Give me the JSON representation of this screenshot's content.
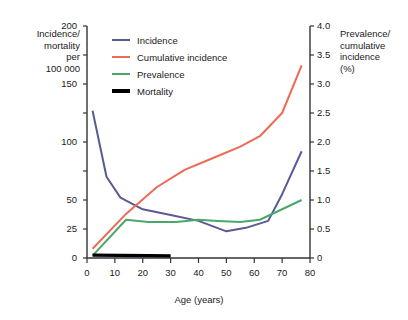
{
  "chart_data": {
    "type": "line",
    "title": "",
    "xlabel": "Age (years)",
    "ylabel": "Incidence/ mortality per 100 000",
    "ylabel_right": "Prevalence/ cumulative incidence (%)",
    "xlim": [
      0,
      80
    ],
    "ylim": [
      0,
      200
    ],
    "ylim_right": [
      0,
      4.0
    ],
    "grid": false,
    "legend_position": "top-left-inside",
    "xticks": [
      0,
      10,
      20,
      30,
      40,
      50,
      60,
      70,
      80
    ],
    "xtick_labels": [
      "0",
      "10",
      "20",
      "30",
      "40",
      "50",
      "60",
      "70",
      "80"
    ],
    "yticks_left": [
      0,
      25,
      50,
      75,
      100,
      125,
      150,
      175,
      200
    ],
    "ytick_labels_left": [
      "0",
      "25",
      "50",
      "",
      "100",
      "",
      "150",
      "",
      "200"
    ],
    "yticks_right": [
      0,
      0.5,
      1.0,
      1.5,
      2.0,
      2.5,
      3.0,
      3.5,
      4.0
    ],
    "ytick_labels_right": [
      "0",
      "0.5",
      "1.0",
      "1.5",
      "2.0",
      "2.5",
      "3.0",
      "3.5",
      "4.0"
    ],
    "series": [
      {
        "name": "Incidence",
        "color": "#5a5a96",
        "axis": "left",
        "width": 2,
        "x": [
          2,
          7,
          12,
          20,
          30,
          40,
          50,
          57,
          65,
          70,
          77
        ],
        "values": [
          127,
          70,
          52,
          42,
          37,
          32,
          23,
          26,
          32,
          55,
          92
        ]
      },
      {
        "name": "Cumulative incidence",
        "color": "#ee6a55",
        "axis": "right",
        "width": 2,
        "x": [
          2,
          14,
          25,
          35,
          45,
          55,
          62,
          70,
          77
        ],
        "values": [
          0.16,
          0.76,
          1.22,
          1.52,
          1.72,
          1.92,
          2.1,
          2.5,
          3.32
        ]
      },
      {
        "name": "Prevalence",
        "color": "#4aa96a",
        "axis": "right",
        "width": 2,
        "x": [
          2,
          14,
          22,
          32,
          40,
          47,
          55,
          62,
          70,
          77
        ],
        "values": [
          0.04,
          0.66,
          0.62,
          0.62,
          0.66,
          0.64,
          0.62,
          0.66,
          0.84,
          1.0
        ]
      },
      {
        "name": "Mortality",
        "color": "#000000",
        "axis": "left",
        "width": 3.2,
        "x": [
          2,
          12,
          22,
          30
        ],
        "values": [
          2.5,
          2.2,
          2.0,
          1.8
        ]
      }
    ]
  },
  "legend": {
    "items": [
      {
        "label": "Incidence",
        "color": "#5a5a96",
        "thick": false
      },
      {
        "label": "Cumulative incidence",
        "color": "#ee6a55",
        "thick": false
      },
      {
        "label": "Prevalence",
        "color": "#4aa96a",
        "thick": false
      },
      {
        "label": "Mortality",
        "color": "#000000",
        "thick": true
      }
    ]
  },
  "axis_titles": {
    "left_line1": "Incidence/",
    "left_line2": "mortality",
    "left_line3": "per",
    "left_line4": "100 000",
    "right_line1": "Prevalence/",
    "right_line2": "cumulative",
    "right_line3": "incidence",
    "right_line4": "(%)",
    "x": "Age (years)"
  }
}
